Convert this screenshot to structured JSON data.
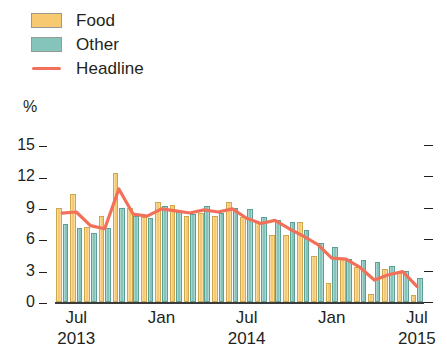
{
  "legend": {
    "items": [
      {
        "label": "Food",
        "type": "swatch",
        "color": "#f7ca72",
        "name": "legend-food"
      },
      {
        "label": "Other",
        "type": "swatch",
        "color": "#84c4ba",
        "name": "legend-other"
      },
      {
        "label": "Headline",
        "type": "line",
        "color": "#f2705a",
        "name": "legend-headline"
      }
    ]
  },
  "axis": {
    "unit": "%",
    "y_ticks": [
      "15",
      "12",
      "9",
      "6",
      "3",
      "0"
    ],
    "x_ticks": [
      {
        "month": "Jul",
        "year": "2013"
      },
      {
        "month": "Jan",
        "year": ""
      },
      {
        "month": "Jul",
        "year": "2014"
      },
      {
        "month": "Jan",
        "year": ""
      },
      {
        "month": "Jul",
        "year": "2015"
      }
    ]
  },
  "chart_data": {
    "type": "bar",
    "title": "",
    "xlabel": "",
    "ylabel": "%",
    "ylim": [
      0,
      15
    ],
    "yticks": [
      0,
      3,
      6,
      9,
      12,
      15
    ],
    "grid": false,
    "legend_position": "top-left",
    "categories": [
      "Jun 2013",
      "Jul 2013",
      "Aug 2013",
      "Sep 2013",
      "Oct 2013",
      "Nov 2013",
      "Dec 2013",
      "Jan 2014",
      "Feb 2014",
      "Mar 2014",
      "Apr 2014",
      "May 2014",
      "Jun 2014",
      "Jul 2014",
      "Aug 2014",
      "Sep 2014",
      "Oct 2014",
      "Nov 2014",
      "Dec 2014",
      "Jan 2015",
      "Feb 2015",
      "Mar 2015",
      "Apr 2015",
      "May 2015",
      "Jun 2015",
      "Jul 2015"
    ],
    "series": [
      {
        "name": "Food",
        "color": "#f7ca72",
        "values": [
          9.0,
          10.3,
          7.2,
          8.2,
          12.3,
          9.0,
          8.1,
          9.6,
          9.3,
          8.2,
          8.5,
          8.2,
          9.6,
          8.1,
          7.6,
          6.4,
          6.4,
          7.6,
          4.4,
          1.8,
          4.2,
          3.3,
          0.8,
          3.2,
          2.8,
          0.7
        ]
      },
      {
        "name": "Other",
        "color": "#84c4ba",
        "values": [
          7.5,
          7.1,
          6.6,
          7.1,
          9.0,
          8.2,
          8.0,
          9.2,
          8.7,
          8.4,
          9.2,
          8.5,
          9.0,
          8.9,
          8.1,
          7.8,
          7.6,
          6.9,
          5.6,
          5.3,
          4.1,
          4.0,
          3.8,
          3.4,
          3.0,
          2.3
        ]
      }
    ],
    "line_series": {
      "name": "Headline",
      "color": "#f2705a",
      "values": [
        8.5,
        8.6,
        7.3,
        7.0,
        10.8,
        8.4,
        8.2,
        8.9,
        8.7,
        8.5,
        8.8,
        8.6,
        8.9,
        8.0,
        7.5,
        7.8,
        7.0,
        6.3,
        5.5,
        4.2,
        4.1,
        3.3,
        2.1,
        2.6,
        2.9,
        1.5
      ]
    }
  },
  "colors": {
    "food": "#f7ca72",
    "other": "#84c4ba",
    "headline": "#f2705a",
    "axis": "#231f20",
    "background": "#ffffff"
  }
}
